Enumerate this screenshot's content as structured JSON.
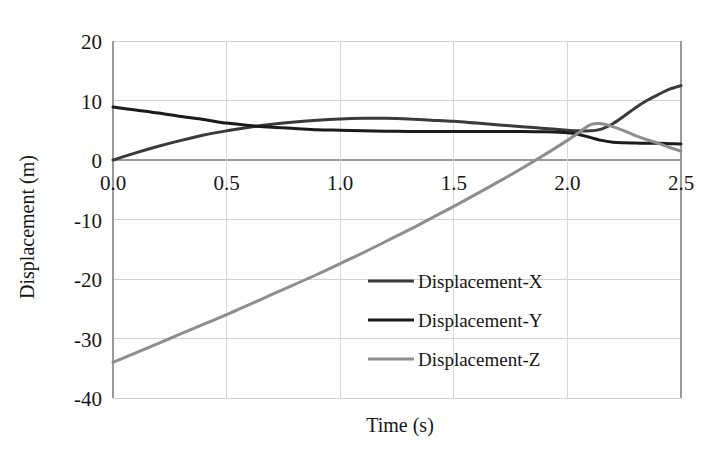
{
  "chart_data": {
    "type": "line",
    "title": "",
    "xlabel": "Time (s)",
    "ylabel": "Displacement (m)",
    "xlim": [
      0.0,
      2.5
    ],
    "ylim": [
      -40,
      20
    ],
    "xticks": [
      "0.0",
      "0.5",
      "1.0",
      "1.5",
      "2.0",
      "2.5"
    ],
    "xtick_values": [
      0.0,
      0.5,
      1.0,
      1.5,
      2.0,
      2.5
    ],
    "yticks": [
      "20",
      "10",
      "0",
      "-10",
      "-20",
      "-30",
      "-40"
    ],
    "ytick_values": [
      20,
      10,
      0,
      -10,
      -20,
      -30,
      -40
    ],
    "grid": "both",
    "legend_position": "center-right-inside",
    "x": [
      0.0,
      0.1,
      0.2,
      0.3,
      0.4,
      0.5,
      0.6,
      0.7,
      0.8,
      0.9,
      1.0,
      1.1,
      1.2,
      1.3,
      1.4,
      1.5,
      1.6,
      1.7,
      1.8,
      1.9,
      2.0,
      2.05,
      2.1,
      2.15,
      2.2,
      2.25,
      2.3,
      2.35,
      2.4,
      2.45,
      2.5
    ],
    "series": [
      {
        "name": "Displacement-X",
        "color": "#3a3a3a",
        "width": 3.0,
        "values": [
          0.0,
          1.2,
          2.3,
          3.3,
          4.2,
          4.9,
          5.5,
          6.0,
          6.4,
          6.7,
          6.9,
          7.0,
          7.0,
          6.9,
          6.7,
          6.5,
          6.2,
          5.9,
          5.6,
          5.3,
          5.0,
          4.9,
          4.9,
          5.2,
          6.1,
          7.4,
          8.8,
          10.0,
          11.0,
          11.9,
          12.5
        ]
      },
      {
        "name": "Displacement-Y",
        "color": "#1b1b1b",
        "width": 3.0,
        "values": [
          8.9,
          8.4,
          7.9,
          7.3,
          6.8,
          6.2,
          5.8,
          5.5,
          5.3,
          5.1,
          5.0,
          4.9,
          4.85,
          4.8,
          4.8,
          4.8,
          4.8,
          4.8,
          4.8,
          4.75,
          4.6,
          4.3,
          3.8,
          3.3,
          3.0,
          2.9,
          2.85,
          2.8,
          2.8,
          2.75,
          2.7
        ]
      },
      {
        "name": "Displacement-Z",
        "color": "#8e8e8e",
        "width": 3.0,
        "values": [
          -34.0,
          -32.4,
          -30.8,
          -29.2,
          -27.6,
          -26.0,
          -24.3,
          -22.6,
          -20.9,
          -19.2,
          -17.4,
          -15.6,
          -13.7,
          -11.8,
          -9.8,
          -7.8,
          -5.7,
          -3.6,
          -1.4,
          0.9,
          3.3,
          4.6,
          5.9,
          6.1,
          5.6,
          4.9,
          4.1,
          3.4,
          2.8,
          2.1,
          1.5
        ]
      }
    ],
    "legend": [
      {
        "label": "Displacement-X",
        "color": "#3a3a3a"
      },
      {
        "label": "Displacement-Y",
        "color": "#1b1b1b"
      },
      {
        "label": "Displacement-Z",
        "color": "#8e8e8e"
      }
    ]
  }
}
